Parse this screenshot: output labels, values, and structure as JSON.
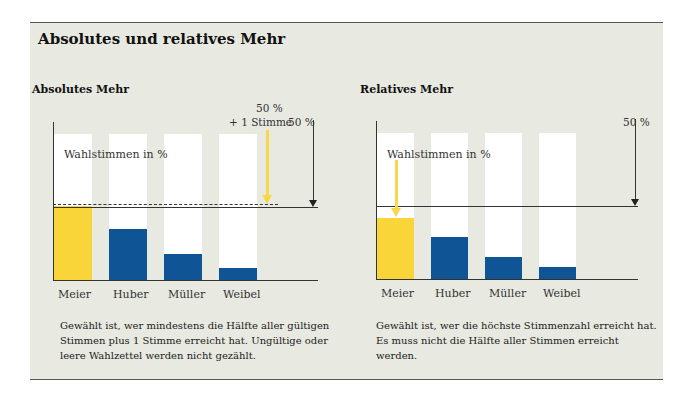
{
  "title": "Absolutes und relatives Mehr",
  "left": {
    "subtitle": "Absolutes Mehr",
    "ylabel": "Wahlstimmen in %",
    "threshold_label_line1": "50 %",
    "threshold_label_line2": "+ 1 Stimme",
    "line_label": "50 %",
    "description": "Gewählt ist, wer mindestens die Hälfte aller gültigen Stimmen plus 1 Stimme erreicht hat. Ungültige oder leere Wahlzettel werden nicht gezählt.",
    "desc_lines": [
      "Gewählt ist, wer mindestens die Hälfte aller gültigen",
      "Stimmen plus 1 Stimme erreicht hat. Ungültige oder",
      "leere Wahlzettel werden nicht gezählt."
    ]
  },
  "right": {
    "subtitle": "Relatives Mehr",
    "ylabel": "Wahlstimmen in %",
    "line_label": "50 %",
    "description": "Gewählt ist, wer die höchste Stimmenzahl erreicht hat. Es muss nicht die Hälfte aller Stimmen erreicht werden.",
    "desc_lines": [
      "Gewählt ist, wer die höchste Stimmenzahl erreicht hat.",
      "Es muss nicht die Hälfte aller Stimmen erreicht werden."
    ]
  },
  "colors": {
    "winner": "#f9d53a",
    "other": "#0f5596",
    "background": "#e8e9e1",
    "bar_track": "#ffffff",
    "arrow_yellow": "#f7d84a"
  },
  "chart_data": [
    {
      "type": "bar",
      "title": "Absolutes Mehr",
      "categories": [
        "Meier",
        "Huber",
        "Müller",
        "Weibel"
      ],
      "values": [
        51,
        35,
        18,
        8
      ],
      "ylabel": "Wahlstimmen in %",
      "ylim": [
        0,
        100
      ],
      "annotations": [
        "50 % + 1 Stimme (dashed line)",
        "50 % (solid line)"
      ],
      "winner": "Meier"
    },
    {
      "type": "bar",
      "title": "Relatives Mehr",
      "categories": [
        "Meier",
        "Huber",
        "Müller",
        "Weibel"
      ],
      "values": [
        42,
        29,
        15,
        8
      ],
      "ylabel": "Wahlstimmen in %",
      "ylim": [
        0,
        100
      ],
      "annotations": [
        "50 % (solid line)"
      ],
      "winner": "Meier"
    }
  ]
}
